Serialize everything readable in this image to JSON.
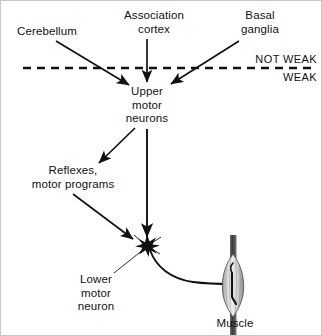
{
  "figure": {
    "background_color": "#ffffff",
    "ink_color": "#111111"
  },
  "labels": {
    "cerebellum": "Cerebellum",
    "association_cortex": "Association\ncortex",
    "basal_ganglia": "Basal\nganglia",
    "not_weak": "NOT WEAK",
    "weak": "WEAK",
    "upper_motor_neurons": "Upper\nmotor\nneurons",
    "reflexes_motor_programs": "Reflexes,\nmotor programs",
    "lower_motor_neuron": "Lower\nmotor\nneuron",
    "muscle": "Muscle"
  },
  "diagram_data": {
    "type": "flow-diagram",
    "divider": {
      "style": "dashed",
      "orientation": "horizontal",
      "y": 67,
      "x_start": 22,
      "x_end": 310,
      "above_label": "NOT WEAK",
      "below_label": "WEAK"
    },
    "nodes": [
      {
        "id": "cerebellum",
        "label": "Cerebellum",
        "side": "not_weak"
      },
      {
        "id": "association-cortex",
        "label": "Association cortex",
        "side": "not_weak"
      },
      {
        "id": "basal-ganglia",
        "label": "Basal ganglia",
        "side": "not_weak"
      },
      {
        "id": "upper-motor-neurons",
        "label": "Upper motor neurons",
        "side": "weak"
      },
      {
        "id": "reflexes",
        "label": "Reflexes, motor programs",
        "side": "weak"
      },
      {
        "id": "lower-motor-neuron",
        "label": "Lower motor neuron",
        "side": "weak"
      },
      {
        "id": "muscle",
        "label": "Muscle",
        "side": "weak"
      }
    ],
    "edges": [
      {
        "from": "cerebellum",
        "to": "upper-motor-neurons",
        "arrow": true,
        "crosses_divider": true
      },
      {
        "from": "association-cortex",
        "to": "upper-motor-neurons",
        "arrow": true,
        "crosses_divider": true
      },
      {
        "from": "basal-ganglia",
        "to": "upper-motor-neurons",
        "arrow": true,
        "crosses_divider": true
      },
      {
        "from": "upper-motor-neurons",
        "to": "lower-motor-neuron",
        "arrow": true,
        "crosses_divider": false
      },
      {
        "from": "upper-motor-neurons",
        "to": "reflexes",
        "arrow": true,
        "crosses_divider": false
      },
      {
        "from": "reflexes",
        "to": "lower-motor-neuron",
        "arrow": true,
        "crosses_divider": false
      },
      {
        "from": "lower-motor-neuron",
        "to": "muscle",
        "arrow": false,
        "crosses_divider": false,
        "style": "axon-curve"
      }
    ]
  }
}
